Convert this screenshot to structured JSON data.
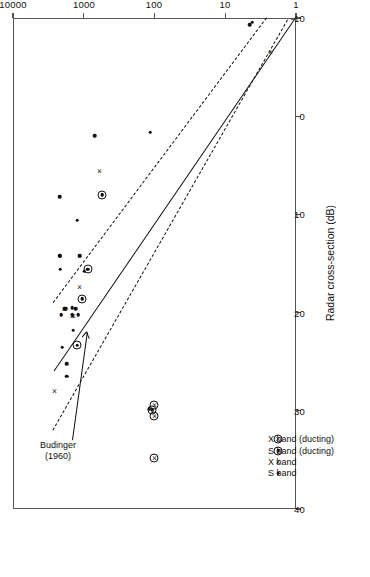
{
  "figure": {
    "rotation_note": "page scanned upside-down; chart rendered rotated 180 degrees"
  },
  "chart_data": {
    "type": "scatter",
    "title": "",
    "xlabel": "Cross-sectional area  (m²)",
    "ylabel": "Radar cross-section (dB)",
    "xscale": "log",
    "xlim": [
      1,
      10000
    ],
    "xticks": [
      1,
      10,
      100,
      1000,
      10000
    ],
    "xticklabels": [
      "1",
      "10",
      "100",
      "1000",
      "10000"
    ],
    "yscale": "linear",
    "ylim": [
      -10,
      40
    ],
    "yticks": [
      -10,
      0,
      10,
      20,
      30,
      40
    ],
    "yticklabels": [
      "-10",
      "0",
      "10",
      "20",
      "30",
      "40"
    ],
    "grid": false,
    "legend_position": "upper-left-inside",
    "legend": [
      {
        "marker": "dot",
        "label": "S band"
      },
      {
        "marker": "cross",
        "label": "X band"
      },
      {
        "marker": "circled-dot",
        "label": "S band (ducting)"
      },
      {
        "marker": "circled-cross",
        "label": "X band (ducting)"
      }
    ],
    "annotations": [
      {
        "text": "Budinger\n(1960)",
        "target_series": "budinger-fit-line"
      }
    ],
    "series": [
      {
        "name": "S band",
        "marker": "dot",
        "points": [
          [
            2000,
            23.5
          ],
          [
            1750,
            26.5
          ],
          [
            1750,
            25.2
          ],
          [
            1400,
            21.8
          ],
          [
            1450,
            20.2
          ],
          [
            1200,
            20.2
          ],
          [
            1300,
            19.6
          ],
          [
            980,
            15.8
          ],
          [
            1150,
            14.2
          ],
          [
            1130,
            14.2
          ],
          [
            1450,
            19.5
          ],
          [
            1800,
            19.6
          ],
          [
            1850,
            19.6
          ],
          [
            2100,
            20.2
          ],
          [
            2150,
            15.6
          ],
          [
            2200,
            14.2
          ],
          [
            2160,
            14.2
          ],
          [
            1250,
            10.6
          ],
          [
            2200,
            8.2
          ],
          [
            115,
            1.6
          ],
          [
            120,
            29.8
          ],
          [
            700,
            2.0
          ],
          [
            4.5,
            -9.3
          ],
          [
            4.2,
            -9.6
          ]
        ]
      },
      {
        "name": "X band",
        "marker": "cross",
        "points": [
          [
            2600,
            28.0
          ],
          [
            1450,
            20.3
          ],
          [
            1400,
            20.3
          ],
          [
            1150,
            17.4
          ],
          [
            1900,
            19.6
          ],
          [
            600,
            5.6
          ],
          [
            2.3,
            -6.5
          ]
        ]
      },
      {
        "name": "S band (ducting)",
        "marker": "circled-dot",
        "points": [
          [
            1250,
            23.3
          ],
          [
            1050,
            18.6
          ],
          [
            880,
            15.6
          ],
          [
            550,
            8.0
          ],
          [
            108,
            29.9
          ]
        ]
      },
      {
        "name": "X band (ducting)",
        "marker": "circled-cross",
        "points": [
          [
            100,
            34.8
          ],
          [
            100,
            30.5
          ],
          [
            100,
            29.4
          ]
        ]
      }
    ],
    "fit_lines": [
      {
        "name": "budinger-fit-line",
        "style": "solid",
        "label": "Budinger (1960)",
        "from": [
          1.0,
          -10.0
        ],
        "to": [
          2600.0,
          26.0
        ]
      },
      {
        "name": "upper-bound-line",
        "style": "dashed",
        "from": [
          1.3,
          -9.8
        ],
        "to": [
          2700.0,
          32.0
        ]
      },
      {
        "name": "lower-bound-line",
        "style": "dashed",
        "from": [
          2.6,
          -10.0
        ],
        "to": [
          2700.0,
          19.0
        ]
      }
    ]
  }
}
